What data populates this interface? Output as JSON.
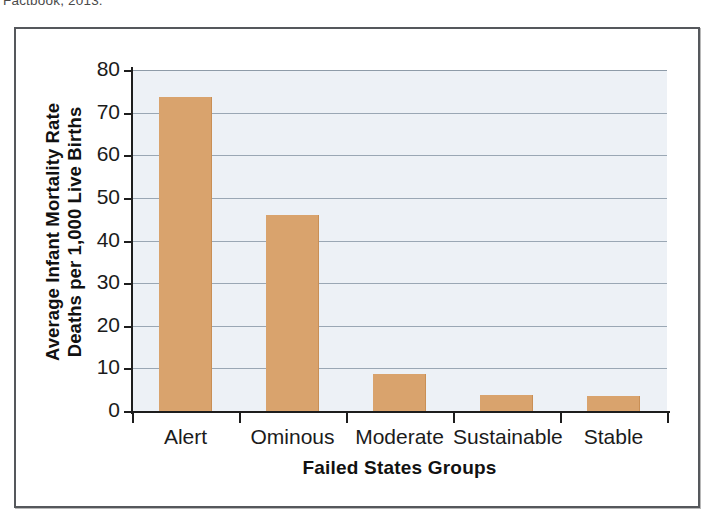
{
  "caption": {
    "text": "Factbook, 2013."
  },
  "chart_data": {
    "type": "bar",
    "title": "",
    "categories": [
      "Alert",
      "Ominous",
      "Moderate",
      "Sustainable",
      "Stable"
    ],
    "values": [
      73.7,
      46.0,
      8.6,
      3.7,
      3.5
    ],
    "series": [
      {
        "name": "Average Infant Mortality Rate",
        "values": [
          73.7,
          46.0,
          8.6,
          3.7,
          3.5
        ]
      }
    ],
    "xlabel": "Failed States Groups",
    "ylabel": "Average Infant Mortality Rate Deaths per 1,000 Live Births",
    "ylabel_lines": [
      "Average Infant Mortality Rate",
      "Deaths per 1,000 Live Births"
    ],
    "ylim": [
      0,
      80
    ],
    "ytick_step": 10,
    "yticks": [
      80,
      70,
      60,
      50,
      40,
      30,
      20,
      10,
      0
    ],
    "ytick_labels": [
      "80",
      "70",
      "60",
      "50",
      "40",
      "30",
      "20",
      "10",
      "0"
    ],
    "grid": true,
    "grid_axis": "y",
    "legend": false,
    "legend_position": "none",
    "bar_color": "#d9a36d",
    "plot_background": "#edf1f6",
    "gridline_color": "#9aa7b4",
    "axis_color": "#1d1d1d",
    "frame_color": "#55585c"
  }
}
